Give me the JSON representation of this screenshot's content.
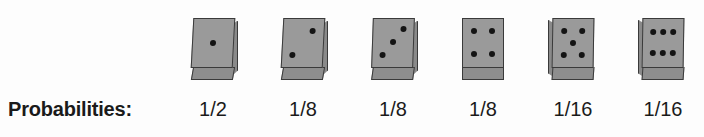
{
  "figure": {
    "label": "Probabilities:",
    "face_color": "#9a9a9a",
    "edge_color": "#3a3a3a",
    "pip_color": "#141414",
    "background": "#fdfdfd"
  },
  "chart_data": {
    "type": "bar",
    "title": "",
    "subtitle": "",
    "xlabel": "",
    "ylabel": "",
    "row_label": "Probabilities:",
    "categories": [
      "1",
      "2",
      "3",
      "4",
      "5",
      "6"
    ],
    "tick_labels": [
      "1/2",
      "1/8",
      "1/8",
      "1/8",
      "1/16",
      "1/16"
    ],
    "values": [
      0.5,
      0.125,
      0.125,
      0.125,
      0.0625,
      0.0625
    ],
    "legend": [],
    "grid": false,
    "annotations": [
      "Unfair die face probabilities shown under each die image"
    ]
  },
  "dice": [
    {
      "name": "die-one",
      "pips": 1,
      "probability": "1/2",
      "pip_positions": [
        [
          50,
          50
        ]
      ],
      "side": "right",
      "tilt": "tilt-a"
    },
    {
      "name": "die-two",
      "pips": 2,
      "probability": "1/8",
      "pip_positions": [
        [
          72,
          24
        ],
        [
          26,
          74
        ]
      ],
      "side": "right",
      "tilt": "tilt-a"
    },
    {
      "name": "die-three",
      "pips": 3,
      "probability": "1/8",
      "pip_positions": [
        [
          74,
          20
        ],
        [
          50,
          48
        ],
        [
          26,
          76
        ]
      ],
      "side": "right",
      "tilt": "tilt-b"
    },
    {
      "name": "die-four",
      "pips": 4,
      "probability": "1/8",
      "pip_positions": [
        [
          28,
          26
        ],
        [
          72,
          26
        ],
        [
          28,
          72
        ],
        [
          72,
          72
        ]
      ],
      "side": "none",
      "tilt": "tilt-flat"
    },
    {
      "name": "die-five",
      "pips": 5,
      "probability": "1/16",
      "pip_positions": [
        [
          27,
          24
        ],
        [
          73,
          24
        ],
        [
          50,
          50
        ],
        [
          27,
          76
        ],
        [
          73,
          76
        ]
      ],
      "side": "left",
      "tilt": "tilt-c"
    },
    {
      "name": "die-six",
      "pips": 6,
      "probability": "1/16",
      "pip_positions": [
        [
          25,
          28
        ],
        [
          50,
          28
        ],
        [
          75,
          28
        ],
        [
          25,
          70
        ],
        [
          50,
          70
        ],
        [
          75,
          70
        ]
      ],
      "side": "left",
      "tilt": "tilt-c"
    }
  ]
}
